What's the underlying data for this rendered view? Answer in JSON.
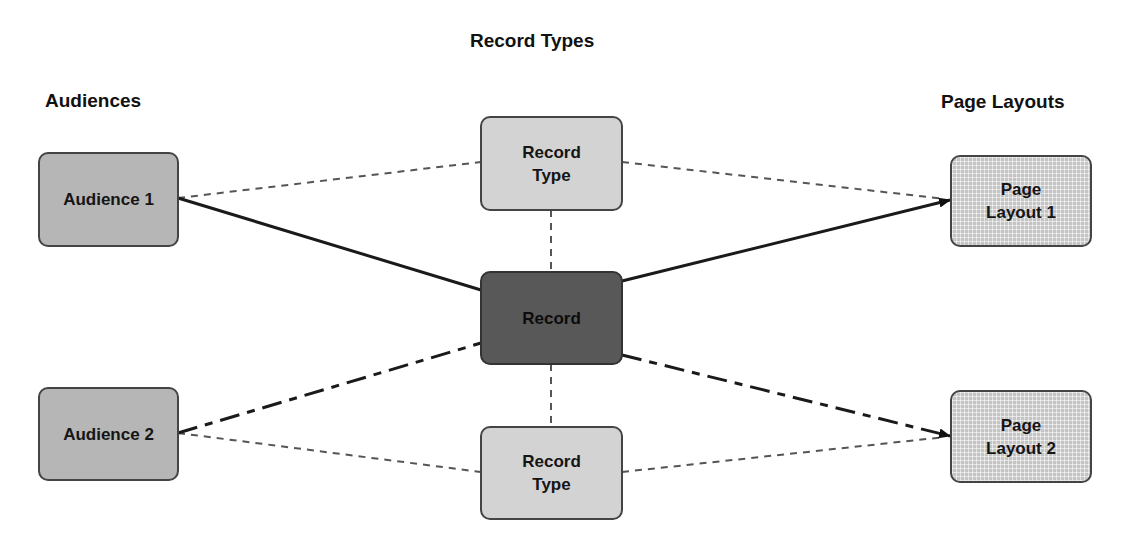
{
  "titles": {
    "audiences": "Audiences",
    "record_types": "Record Types",
    "page_layouts": "Page Layouts"
  },
  "nodes": {
    "audience_1": "Audience 1",
    "audience_2": "Audience 2",
    "record_type_top": [
      "Record",
      "Type"
    ],
    "record_type_bottom": [
      "Record",
      "Type"
    ],
    "record": "Record",
    "page_layout_1": [
      "Page",
      "Layout 1"
    ],
    "page_layout_2": [
      "Page",
      "Layout 2"
    ]
  },
  "edges": [
    {
      "from": "Audience 1",
      "to": "Record Type (top)",
      "style": "dashed"
    },
    {
      "from": "Audience 1",
      "to": "Record",
      "style": "solid"
    },
    {
      "from": "Record Type (top)",
      "to": "Page Layout 1",
      "style": "dashed"
    },
    {
      "from": "Record",
      "to": "Page Layout 1",
      "style": "solid",
      "arrow": true
    },
    {
      "from": "Record Type (top)",
      "to": "Record",
      "style": "dashed"
    },
    {
      "from": "Record",
      "to": "Record Type (bottom)",
      "style": "dashed"
    },
    {
      "from": "Audience 2",
      "to": "Record",
      "style": "dash-dot"
    },
    {
      "from": "Audience 2",
      "to": "Record Type (bottom)",
      "style": "dashed"
    },
    {
      "from": "Record",
      "to": "Page Layout 2",
      "style": "dash-dot",
      "arrow": true
    },
    {
      "from": "Record Type (bottom)",
      "to": "Page Layout 2",
      "style": "dashed"
    }
  ],
  "colors": {
    "audience_fill": "#b6b6b6",
    "record_type_fill": "#d3d3d3",
    "record_fill": "#585858",
    "page_layout_fill": "#c4c4c4",
    "line": "#222222",
    "dashed_line": "#555555"
  }
}
